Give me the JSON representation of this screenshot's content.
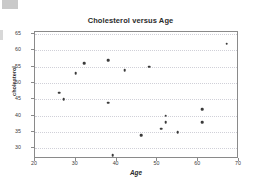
{
  "chart_data": {
    "type": "scatter",
    "title": "Cholesterol versus Age",
    "xlabel": "Age",
    "ylabel": "cholesterol",
    "xlim": [
      20,
      70
    ],
    "ylim": [
      28,
      65
    ],
    "xticks": [
      20,
      30,
      40,
      50,
      60,
      70
    ],
    "yticks": [
      30,
      35,
      40,
      45,
      50,
      55,
      60,
      65
    ],
    "grid": true,
    "legend": null,
    "marker_color": "#3a3a3a",
    "frame_color": "#8a8a8a",
    "series": [
      {
        "name": "observations",
        "points": [
          {
            "x": 26,
            "y": 47
          },
          {
            "x": 27,
            "y": 45
          },
          {
            "x": 30,
            "y": 53
          },
          {
            "x": 32,
            "y": 56
          },
          {
            "x": 38,
            "y": 57
          },
          {
            "x": 38,
            "y": 44
          },
          {
            "x": 39,
            "y": 28
          },
          {
            "x": 42,
            "y": 54
          },
          {
            "x": 46,
            "y": 34
          },
          {
            "x": 48,
            "y": 55
          },
          {
            "x": 51,
            "y": 36
          },
          {
            "x": 52,
            "y": 40
          },
          {
            "x": 52,
            "y": 38
          },
          {
            "x": 55,
            "y": 35
          },
          {
            "x": 61,
            "y": 42
          },
          {
            "x": 61,
            "y": 38
          },
          {
            "x": 67,
            "y": 62
          }
        ]
      }
    ]
  }
}
